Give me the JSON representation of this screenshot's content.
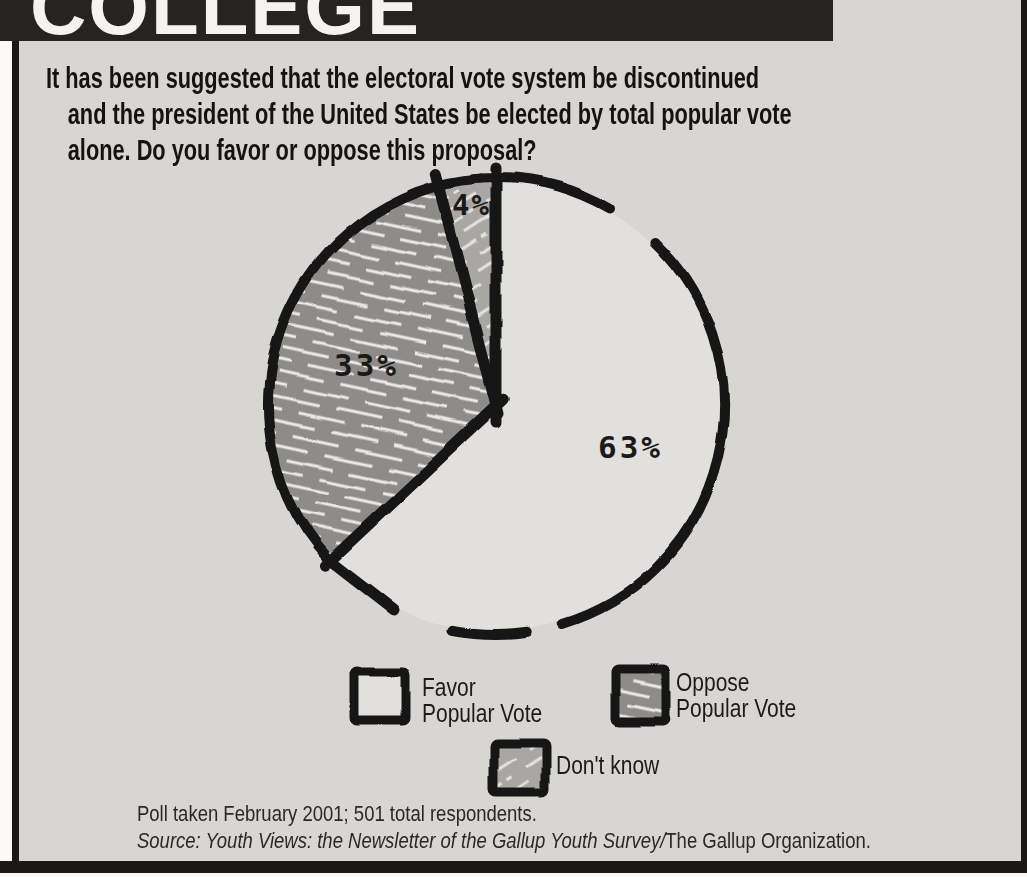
{
  "banner": {
    "title": "COLLEGE"
  },
  "question": {
    "lines": [
      "It has been suggested that the electoral vote system be discontinued",
      "and the president of the United States be elected by total popular vote",
      "alone. Do you favor or oppose this proposal?"
    ]
  },
  "chart_data": {
    "type": "pie",
    "title": "",
    "labels": [
      "Favor Popular Vote",
      "Oppose Popular Vote",
      "Don't know"
    ],
    "values": [
      63,
      33,
      4
    ],
    "slice_display": [
      "63%",
      "33%",
      "4%"
    ],
    "start_angle_deg": 0,
    "direction": "clockwise",
    "styles": [
      "plain-light",
      "dark-hatch",
      "light-hatch"
    ],
    "colors": {
      "plain-light": "#e1e0dd",
      "dark-base": "#8d8c88",
      "medium-base": "#a8a7a3",
      "hatch-streak": "#eceae6",
      "ink": "#181614",
      "panel_bg": "#d8d6d2",
      "banner_bg": "#262322"
    }
  },
  "legend": {
    "items": [
      {
        "swatch": "plain-light",
        "lines": [
          "Favor",
          "Popular Vote"
        ]
      },
      {
        "swatch": "dark-hatch",
        "lines": [
          "Oppose",
          "Popular Vote"
        ]
      },
      {
        "swatch": "light-hatch",
        "lines": [
          "Don't know"
        ]
      }
    ]
  },
  "footer": {
    "poll_note": "Poll taken February 2001; 501 total respondents.",
    "source_italic": "Source: Youth Views: the Newsletter of the Gallup Youth Survey/",
    "source_roman": "The Gallup Organization."
  }
}
